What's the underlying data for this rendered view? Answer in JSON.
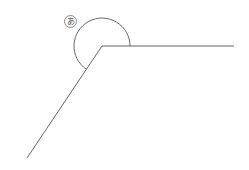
{
  "diagram": {
    "type": "angle",
    "angle_label": "あ",
    "stroke_color": "#666666",
    "vertex": [
      102,
      46
    ],
    "ray_right_end": [
      234,
      46
    ],
    "ray_down_left_end": [
      27,
      158
    ],
    "arc_radius": 28,
    "arc_marks": "reflex angle"
  }
}
